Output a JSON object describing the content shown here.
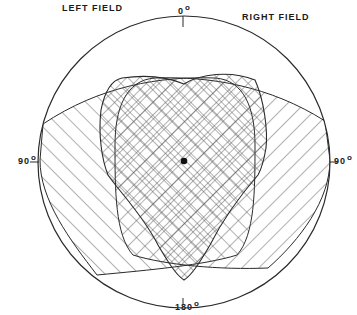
{
  "diagram": {
    "labels": {
      "left_field": "LEFT FIELD",
      "right_field": "RIGHT FIELD",
      "top": "0",
      "left": "90",
      "right": "90",
      "bottom": "180",
      "degree_symbol": "o"
    },
    "regions": [
      {
        "name": "binocular-overlap",
        "pattern": "cross-hatch"
      },
      {
        "name": "left-monocular-field",
        "pattern": "diagonal-hatch"
      },
      {
        "name": "right-monocular-field",
        "pattern": "diagonal-hatch"
      }
    ],
    "colors": {
      "line": "#2a2a2a",
      "hatch": "#555555",
      "background": "#ffffff"
    }
  }
}
